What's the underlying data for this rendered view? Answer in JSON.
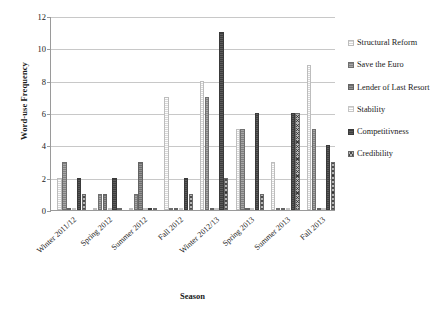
{
  "chart_data": {
    "type": "bar",
    "title": "",
    "xlabel": "Season",
    "ylabel": "Word-use Frequency",
    "ylim": [
      0,
      12
    ],
    "ytick_step": 2,
    "yticks": [
      0,
      2,
      4,
      6,
      8,
      10,
      12
    ],
    "grid": true,
    "legend_position": "right",
    "categories": [
      "Winter 2011/12",
      "Spring 2012",
      "Summer 2012",
      "Fall 2012",
      "Winter 2012/13",
      "Spring 2013",
      "Summer 2013",
      "Fall 2013"
    ],
    "series": [
      {
        "name": "Structural Reform",
        "color": "#e9e9e9",
        "values": [
          2,
          0,
          0,
          7,
          8,
          5,
          3,
          9
        ]
      },
      {
        "name": "Save the Euro",
        "color": "#8e8e8e",
        "values": [
          3,
          1,
          1,
          0,
          7,
          5,
          0,
          5
        ]
      },
      {
        "name": "Lender of Last Resort",
        "color": "#7d7d7d",
        "values": [
          0,
          1,
          3,
          0,
          0,
          0,
          0,
          0
        ]
      },
      {
        "name": "Stability",
        "color": "#f3f3f3",
        "values": [
          0,
          0,
          0,
          0,
          0,
          0,
          0,
          0
        ]
      },
      {
        "name": "Competitivness",
        "color": "#4a4a4a",
        "values": [
          2,
          2,
          0,
          2,
          11,
          6,
          6,
          4
        ]
      },
      {
        "name": "Credibility",
        "color": "#b4b4b4",
        "values": [
          1,
          0,
          0,
          1,
          2,
          1,
          6,
          3
        ]
      }
    ]
  },
  "legend": {
    "items": [
      {
        "label": "Structural Reform"
      },
      {
        "label": "Save the Euro"
      },
      {
        "label": "Lender of Last Resort"
      },
      {
        "label": "Stability"
      },
      {
        "label": "Competitivness"
      },
      {
        "label": "Credibility"
      }
    ]
  }
}
